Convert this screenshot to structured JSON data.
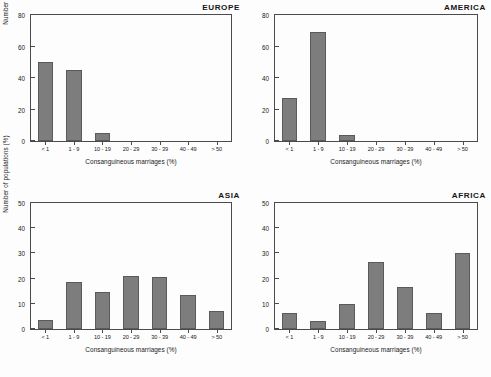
{
  "figure": {
    "xlabel": "Consanguineous marriages (%)",
    "ylabel": "Number of populations (%)",
    "bar_color": "#7d7d7d",
    "axis_color": "#4b4b4b",
    "background": "#fdfdfd"
  },
  "chart_data": [
    {
      "type": "bar",
      "title": "EUROPE",
      "xlabel": "Consanguineous marriages (%)",
      "ylabel": "Number of populations (%)",
      "categories": [
        "< 1",
        "1 - 9",
        "10 - 19",
        "20 - 29",
        "30 - 39",
        "40 - 49",
        "> 50"
      ],
      "values": [
        50,
        45,
        5,
        0,
        0,
        0,
        0
      ],
      "ylim": [
        0,
        80
      ],
      "yticks": [
        0,
        20,
        40,
        60,
        80
      ],
      "grid": false,
      "legend": "none"
    },
    {
      "type": "bar",
      "title": "AMERICA",
      "xlabel": "Consanguineous marriages (%)",
      "ylabel": "Number of populations (%)",
      "categories": [
        "< 1",
        "1 - 9",
        "10 - 19",
        "20 - 29",
        "30 - 39",
        "40 - 49",
        "> 50"
      ],
      "values": [
        27,
        69,
        4,
        0,
        0,
        0,
        0
      ],
      "ylim": [
        0,
        80
      ],
      "yticks": [
        0,
        20,
        40,
        60,
        80
      ],
      "grid": false,
      "legend": "none"
    },
    {
      "type": "bar",
      "title": "ASIA",
      "xlabel": "Consanguineous marriages (%)",
      "ylabel": "Number of populations (%)",
      "categories": [
        "< 1",
        "1 - 9",
        "10 - 19",
        "20 - 29",
        "30 - 39",
        "40 - 49",
        "> 50"
      ],
      "values": [
        3.5,
        18.5,
        14.5,
        21,
        20.5,
        13.5,
        7
      ],
      "ylim": [
        0,
        50
      ],
      "yticks": [
        0,
        10,
        20,
        30,
        40,
        50
      ],
      "grid": false,
      "legend": "none"
    },
    {
      "type": "bar",
      "title": "AFRICA",
      "xlabel": "Consanguineous marriages (%)",
      "ylabel": "Number of populations (%)",
      "categories": [
        "< 1",
        "1 - 9",
        "10 - 19",
        "20 - 29",
        "30 - 39",
        "40 - 49",
        "> 50"
      ],
      "values": [
        6.5,
        3.3,
        10,
        26.5,
        16.5,
        6.3,
        30
      ],
      "ylim": [
        0,
        50
      ],
      "yticks": [
        0,
        10,
        20,
        30,
        40,
        50
      ],
      "grid": false,
      "legend": "none"
    }
  ]
}
